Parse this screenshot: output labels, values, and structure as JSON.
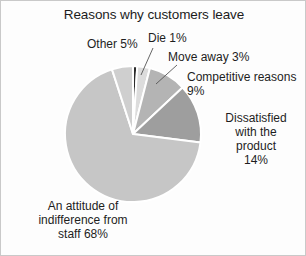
{
  "chart_data": {
    "type": "pie",
    "title": "Reasons why customers leave",
    "xlabel": "",
    "ylabel": "",
    "units": "percent",
    "legend_position": "none",
    "grid": false,
    "labels_outside": true,
    "start_angle_deg": 0,
    "direction": "clockwise",
    "categories": [
      "Die",
      "Move away",
      "Competitive reasons",
      "Dissatisfied with the product",
      "An attitude of indifference from staff",
      "Other"
    ],
    "values": [
      1,
      3,
      9,
      14,
      68,
      5
    ],
    "slices": [
      {
        "name": "Die",
        "value": 1,
        "label_text": "Die 1%",
        "color": "#2b2b2b",
        "start_deg": 0,
        "end_deg": 3.6
      },
      {
        "name": "Move away",
        "value": 3,
        "label_text": "Move away 3%",
        "color": "#dcdcdc",
        "start_deg": 3.6,
        "end_deg": 14.4
      },
      {
        "name": "Competitive reasons",
        "value": 9,
        "label_text": "Competitive reasons\n9%",
        "color": "#b4b4b4",
        "start_deg": 14.4,
        "end_deg": 46.8
      },
      {
        "name": "Dissatisfied with the product",
        "value": 14,
        "label_text": "Dissatisfied\nwith the\nproduct\n14%",
        "color": "#9e9e9e",
        "start_deg": 46.8,
        "end_deg": 97.2
      },
      {
        "name": "An attitude of indifference from staff",
        "value": 68,
        "label_text": "An attitude of\nindifference from\nstaff 68%",
        "color": "#c6c6c6",
        "start_deg": 97.2,
        "end_deg": 342.0
      },
      {
        "name": "Other",
        "value": 5,
        "label_text": "Other 5%",
        "color": "#cfcfcf",
        "start_deg": 342.0,
        "end_deg": 360.0
      }
    ],
    "total": 100,
    "geometry": {
      "center_x": 132,
      "center_y": 133,
      "radius": 68,
      "separator_color": "#ffffff",
      "separator_width": 2
    },
    "frame": {
      "background": "#fdfdfd",
      "border_color": "#c9c9c9"
    }
  }
}
